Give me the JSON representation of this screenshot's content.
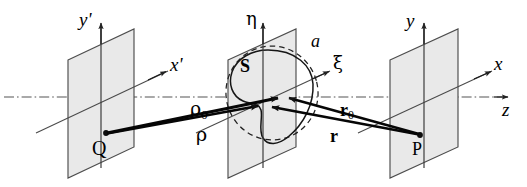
{
  "figure": {
    "type": "optics-diagram",
    "background_color": "#ffffff",
    "line_color": "#1a1a1a",
    "plane_fill_color": "#e8e8e8",
    "plane_edge_color": "#4a4a4a"
  },
  "planes": [
    {
      "id": "source-plane",
      "name": "source-plane",
      "axes": [
        {
          "name": "y-prime-axis",
          "label": "y'",
          "direction": "vertical"
        },
        {
          "name": "x-prime-axis",
          "label": "x'",
          "direction": "oblique"
        }
      ],
      "points": [
        {
          "name": "point-Q",
          "label": "Q"
        }
      ]
    },
    {
      "id": "aperture-plane",
      "name": "aperture-plane",
      "axes": [
        {
          "name": "eta-axis",
          "label": "η",
          "direction": "vertical"
        },
        {
          "name": "xi-axis",
          "label": "ξ",
          "direction": "oblique"
        }
      ],
      "shapes": [
        {
          "name": "aperture-radius-label",
          "label": "a",
          "style": "dashed-circle"
        },
        {
          "name": "aperture-surface-label",
          "label": "S",
          "style": "solid-closed-curve"
        }
      ]
    },
    {
      "id": "observation-plane",
      "name": "observation-plane",
      "axes": [
        {
          "name": "y-axis",
          "label": "y",
          "direction": "vertical"
        },
        {
          "name": "x-axis",
          "label": "x",
          "direction": "oblique"
        }
      ],
      "points": [
        {
          "name": "point-P",
          "label": "P"
        }
      ]
    }
  ],
  "optical_axis": {
    "name": "z-axis",
    "label": "z",
    "style": "dash-dot"
  },
  "vectors": [
    {
      "name": "vector-rho-zero",
      "label": "ρ",
      "subscript": "0",
      "bold": false,
      "from": "Q",
      "to": "aperture-origin"
    },
    {
      "name": "vector-rho",
      "label": "ρ",
      "subscript": "",
      "bold": false,
      "from": "Q",
      "to": "aperture-point"
    },
    {
      "name": "vector-r-zero",
      "label": "r",
      "subscript": "0",
      "bold": true,
      "from": "P",
      "to": "aperture-origin"
    },
    {
      "name": "vector-r",
      "label": "r",
      "subscript": "",
      "bold": true,
      "from": "P",
      "to": "aperture-point"
    }
  ],
  "labels": {
    "y_prime": "y'",
    "x_prime": "x'",
    "eta": "η",
    "xi": "ξ",
    "y": "y",
    "x": "x",
    "z": "z",
    "Q": "Q",
    "P": "P",
    "S": "S",
    "a": "a",
    "rho": "ρ",
    "rho_sub": "0",
    "r": "r",
    "r_sub": "0"
  }
}
